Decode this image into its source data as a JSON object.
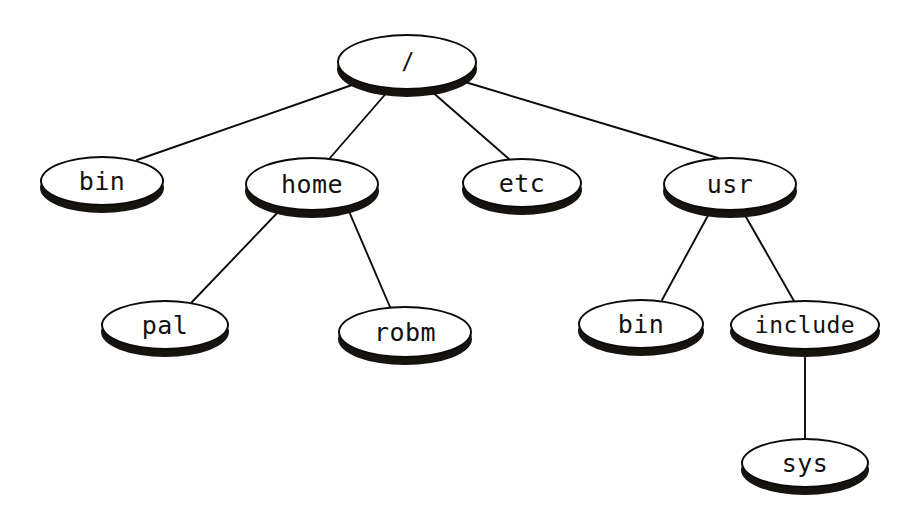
{
  "diagram": {
    "type": "tree",
    "background_color": "#ffffff",
    "node_fill_color": "#ffffff",
    "node_outline_color": "#0d0b09",
    "node_shadow_color": "#17130f",
    "edge_color": "#0d0b09",
    "nodes": [
      {
        "id": "root",
        "label": "/",
        "cx": 407,
        "cy": 62,
        "rx": 70,
        "ry": 28
      },
      {
        "id": "bin",
        "label": "bin",
        "cx": 102,
        "cy": 181,
        "rx": 62,
        "ry": 25
      },
      {
        "id": "home",
        "label": "home",
        "cx": 312,
        "cy": 184,
        "rx": 67,
        "ry": 27
      },
      {
        "id": "etc",
        "label": "etc",
        "cx": 522,
        "cy": 183,
        "rx": 60,
        "ry": 25
      },
      {
        "id": "usr",
        "label": "usr",
        "cx": 730,
        "cy": 184,
        "rx": 67,
        "ry": 27
      },
      {
        "id": "pal",
        "label": "pal",
        "cx": 165,
        "cy": 325,
        "rx": 64,
        "ry": 25
      },
      {
        "id": "robm",
        "label": "robm",
        "cx": 405,
        "cy": 332,
        "rx": 67,
        "ry": 26
      },
      {
        "id": "usr-bin",
        "label": "bin",
        "cx": 641,
        "cy": 324,
        "rx": 63,
        "ry": 25
      },
      {
        "id": "include",
        "label": "include",
        "cx": 805,
        "cy": 325,
        "rx": 75,
        "ry": 25
      },
      {
        "id": "sys",
        "label": "sys",
        "cx": 805,
        "cy": 463,
        "rx": 64,
        "ry": 25
      }
    ],
    "edges": [
      {
        "from": "root",
        "to": "bin",
        "x1": 352,
        "y1": 85,
        "x2": 137,
        "y2": 160
      },
      {
        "from": "root",
        "to": "home",
        "x1": 389,
        "y1": 90,
        "x2": 330,
        "y2": 158
      },
      {
        "from": "root",
        "to": "etc",
        "x1": 430,
        "y1": 90,
        "x2": 509,
        "y2": 159
      },
      {
        "from": "root",
        "to": "usr",
        "x1": 465,
        "y1": 82,
        "x2": 718,
        "y2": 158
      },
      {
        "from": "home",
        "to": "pal",
        "x1": 281,
        "y1": 209,
        "x2": 192,
        "y2": 302
      },
      {
        "from": "home",
        "to": "robm",
        "x1": 348,
        "y1": 209,
        "x2": 390,
        "y2": 307
      },
      {
        "from": "usr",
        "to": "usr-bin",
        "x1": 711,
        "y1": 210,
        "x2": 662,
        "y2": 300
      },
      {
        "from": "usr",
        "to": "include",
        "x1": 742,
        "y1": 210,
        "x2": 794,
        "y2": 301
      },
      {
        "from": "include",
        "to": "sys",
        "x1": 805,
        "y1": 352,
        "x2": 805,
        "y2": 439
      }
    ]
  }
}
